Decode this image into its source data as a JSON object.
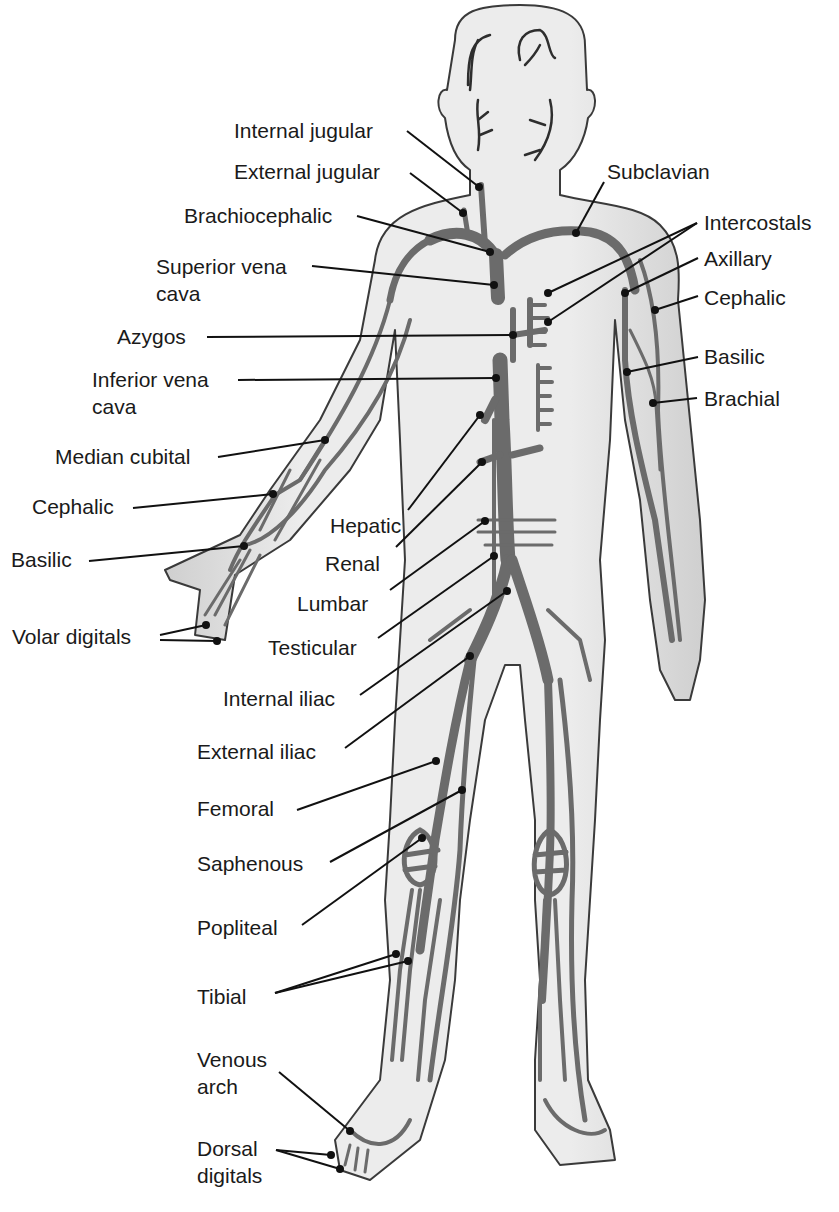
{
  "figure": {
    "colors": {
      "background": "#ffffff",
      "skin": "#e6e6e6",
      "skin_outline": "#3a3a3a",
      "vein": "#6b6b6b",
      "vein_outline": "#2e2e2e",
      "leader": "#111111",
      "text": "#1a1a1a"
    }
  },
  "labels": {
    "internal_jugular": "Internal jugular",
    "external_jugular": "External jugular",
    "brachiocephalic": "Brachiocephalic",
    "superior_vena_cava_1": "Superior vena",
    "superior_vena_cava_2": "cava",
    "azygos": "Azygos",
    "inferior_vena_cava_1": "Inferior vena",
    "inferior_vena_cava_2": "cava",
    "median_cubital": "Median cubital",
    "cephalic_left": "Cephalic",
    "basilic_left": "Basilic",
    "volar_digitals": "Volar digitals",
    "hepatic": "Hepatic",
    "renal": "Renal",
    "lumbar": "Lumbar",
    "testicular": "Testicular",
    "internal_iliac": "Internal iliac",
    "external_iliac": "External iliac",
    "femoral": "Femoral",
    "saphenous": "Saphenous",
    "popliteal": "Popliteal",
    "tibial": "Tibial",
    "venous_arch_1": "Venous",
    "venous_arch_2": "arch",
    "dorsal_digitals_1": "Dorsal",
    "dorsal_digitals_2": "digitals",
    "subclavian": "Subclavian",
    "intercostals": "Intercostals",
    "axillary": "Axillary",
    "cephalic_right": "Cephalic",
    "basilic_right": "Basilic",
    "brachial": "Brachial"
  }
}
